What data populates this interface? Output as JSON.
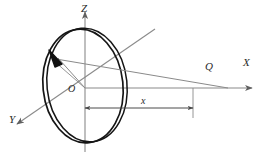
{
  "figure": {
    "diagram_type": "physics-geometry-schematic",
    "background_color": "#ffffff",
    "line_color": "#6e6e6e",
    "ring_color": "#1a1a1a",
    "label_color": "#2a2a2a"
  },
  "axes": [
    {
      "name": "z-axis",
      "label": "Z",
      "direction": "up",
      "arrow": true
    },
    {
      "name": "x-axis",
      "label": "X",
      "direction": "right",
      "arrow": true
    },
    {
      "name": "y-axis",
      "label": "Y",
      "direction": "down-left",
      "arrow": true
    }
  ],
  "points": [
    {
      "name": "origin",
      "label": "O"
    },
    {
      "name": "field-point",
      "label": "Q"
    }
  ],
  "dimensions": [
    {
      "name": "distance-x",
      "label": "x",
      "from": "origin",
      "to": "field-point",
      "style": "double-headed-arrow"
    }
  ],
  "elements": [
    {
      "name": "ring",
      "description": "thin circular ring shown in perspective as an ellipse"
    },
    {
      "name": "ring-element-arrow",
      "description": "bold arrowhead marking a source element on the ring"
    },
    {
      "name": "radius-line",
      "description": "line from origin O to the ring element"
    },
    {
      "name": "distance-line",
      "description": "line from the ring element to the field point Q"
    }
  ]
}
